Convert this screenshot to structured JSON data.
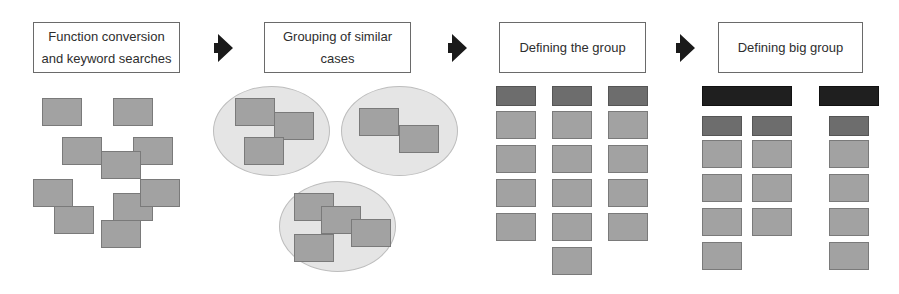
{
  "diagram": {
    "stages": [
      {
        "label_line1": "Function conversion",
        "label_line2": "and keyword searches"
      },
      {
        "label_line1": "Grouping of similar",
        "label_line2": "cases"
      },
      {
        "label_line1": "Defining the group",
        "label_line2": ""
      },
      {
        "label_line1": "Defining big group",
        "label_line2": ""
      }
    ],
    "arrows": [
      {
        "icon": "arrow-right-icon",
        "from": 1,
        "to": 2
      },
      {
        "icon": "arrow-right-icon",
        "from": 2,
        "to": 3
      },
      {
        "icon": "arrow-right-icon",
        "from": 3,
        "to": 4
      }
    ],
    "colors": {
      "card_light": "#a2a2a2",
      "card_mid": "#6d6d6d",
      "card_dark": "#1f1f1f",
      "ellipse_fill": "#e5e5e5",
      "box_border": "#6a6a6a",
      "arrow": "#1a1a1a"
    },
    "stage1_scattered_cards": 10,
    "stage2_groups": [
      3,
      2,
      4
    ],
    "stage3_columns": [
      {
        "header": "mid",
        "items": 4
      },
      {
        "header": "mid",
        "items": 5
      },
      {
        "header": "mid",
        "items": 4
      }
    ],
    "stage4_big_groups": [
      {
        "header": "dark",
        "sub_columns": [
          {
            "header": "mid",
            "items": 4
          },
          {
            "header": "mid",
            "items": 3
          }
        ]
      },
      {
        "header": "dark",
        "sub_columns": [
          {
            "header": "mid",
            "items": 4
          }
        ]
      }
    ]
  }
}
